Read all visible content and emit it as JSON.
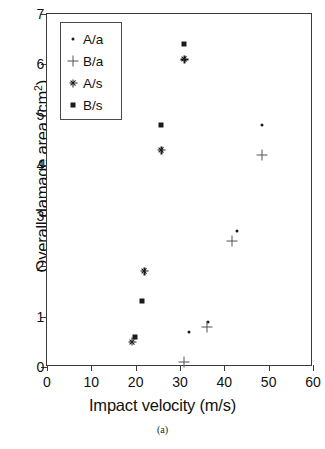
{
  "chart_data": {
    "type": "scatter",
    "title": "",
    "xlabel": "Impact velocity (m/s)",
    "ylabel": "Overall damage area (cm2)",
    "ylabel_base": "Overall damage area (cm",
    "ylabel_sup": "2",
    "ylabel_close": ")",
    "caption": "(a)",
    "xlim": [
      0,
      60
    ],
    "ylim": [
      0,
      7
    ],
    "xticks": [
      0,
      10,
      20,
      30,
      40,
      50,
      60
    ],
    "yticks": [
      0,
      1,
      2,
      3,
      4,
      5,
      6,
      7
    ],
    "grid": false,
    "legend_position": "top-left",
    "marker_color": "#1b1b1b",
    "series": [
      {
        "name": "A/a",
        "marker": "dot",
        "points": [
          {
            "x": 32.0,
            "y": 0.7
          },
          {
            "x": 36.3,
            "y": 0.9
          },
          {
            "x": 42.8,
            "y": 2.7
          },
          {
            "x": 48.6,
            "y": 4.8
          }
        ]
      },
      {
        "name": "B/a",
        "marker": "plus",
        "points": [
          {
            "x": 31.0,
            "y": 0.1
          },
          {
            "x": 36.0,
            "y": 0.8
          },
          {
            "x": 41.8,
            "y": 2.5
          },
          {
            "x": 48.5,
            "y": 4.2
          }
        ]
      },
      {
        "name": "A/s",
        "marker": "asterisk",
        "points": [
          {
            "x": 19.2,
            "y": 0.5
          },
          {
            "x": 22.0,
            "y": 1.9
          },
          {
            "x": 25.8,
            "y": 4.3
          },
          {
            "x": 31.0,
            "y": 6.1
          }
        ]
      },
      {
        "name": "B/s",
        "marker": "square",
        "points": [
          {
            "x": 19.8,
            "y": 0.6
          },
          {
            "x": 21.5,
            "y": 1.3
          },
          {
            "x": 25.8,
            "y": 4.8
          },
          {
            "x": 31.0,
            "y": 6.4
          }
        ]
      }
    ]
  }
}
